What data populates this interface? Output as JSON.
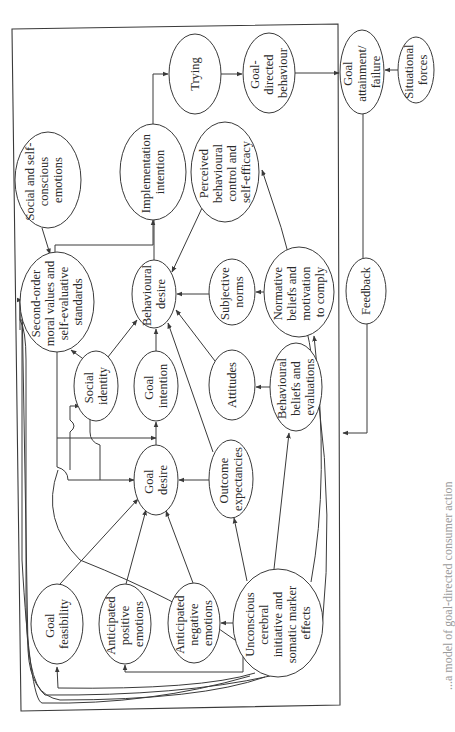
{
  "diagram": {
    "orientation": "rotated-90-ccw",
    "colors": {
      "stroke": "#3a3a3a",
      "text": "#2a2a2a",
      "background": "#ffffff"
    },
    "nodes": {
      "social_self_conscious_emotions": {
        "lines": [
          "Social and self-",
          "conscious",
          "emotions"
        ]
      },
      "implementation_intention": {
        "lines": [
          "Implementation",
          "intention"
        ]
      },
      "trying": {
        "lines": [
          "Trying"
        ]
      },
      "goal_directed_behaviour": {
        "lines": [
          "Goal-",
          "directed",
          "behaviour"
        ]
      },
      "goal_attainment_failure": {
        "lines": [
          "Goal",
          "attainment/",
          "failure"
        ]
      },
      "situational_forces": {
        "lines": [
          "Situational",
          "forces"
        ]
      },
      "perceived_behavioural_control": {
        "lines": [
          "Perceived",
          "behavioural",
          "control and",
          "self-efficacy"
        ]
      },
      "second_order_moral_values": {
        "lines": [
          "Second-order",
          "moral values and",
          "self-evaluative",
          "standards"
        ]
      },
      "behavioural_desire": {
        "lines": [
          "Behavioural",
          "desire"
        ]
      },
      "subjective_norms": {
        "lines": [
          "Subjective",
          "norms"
        ]
      },
      "normative_beliefs": {
        "lines": [
          "Normative",
          "beliefs and",
          "motivation",
          "to comply"
        ]
      },
      "feedback": {
        "lines": [
          "Feedback"
        ]
      },
      "social_identity": {
        "lines": [
          "Social",
          "identity"
        ]
      },
      "goal_intention": {
        "lines": [
          "Goal",
          "intention"
        ]
      },
      "attitudes": {
        "lines": [
          "Attitudes"
        ]
      },
      "behavioural_beliefs": {
        "lines": [
          "Behavioural",
          "beliefs and",
          "evaluations"
        ]
      },
      "goal_desire": {
        "lines": [
          "Goal",
          "desire"
        ]
      },
      "outcome_expectancies": {
        "lines": [
          "Outcome",
          "expectancies"
        ]
      },
      "goal_feasibility": {
        "lines": [
          "Goal",
          "feasibility"
        ]
      },
      "anticipated_positive_emotions": {
        "lines": [
          "Anticipated",
          "positive",
          "emotions"
        ]
      },
      "anticipated_negative_emotions": {
        "lines": [
          "Anticipated",
          "negative",
          "emotions"
        ]
      },
      "unconscious_cerebral_initiative": {
        "lines": [
          "Unconscious",
          "cerebral",
          "initiative and",
          "somatic marker",
          "effects"
        ]
      }
    },
    "edges": [
      [
        "implementation_intention",
        "trying"
      ],
      [
        "trying",
        "goal_directed_behaviour"
      ],
      [
        "goal_directed_behaviour",
        "goal_attainment_failure"
      ],
      [
        "situational_forces",
        "goal_attainment_failure"
      ],
      [
        "goal_attainment_failure",
        "feedback"
      ],
      [
        "feedback",
        "behavioural_beliefs"
      ],
      [
        "social_self_conscious_emotions",
        "second_order_moral_values"
      ],
      [
        "second_order_moral_values",
        "implementation_intention"
      ],
      [
        "second_order_moral_values",
        "goal_intention"
      ],
      [
        "second_order_moral_values",
        "goal_desire"
      ],
      [
        "social_identity",
        "second_order_moral_values"
      ],
      [
        "social_identity",
        "behavioural_desire"
      ],
      [
        "goal_desire",
        "social_identity"
      ],
      [
        "behavioural_desire",
        "implementation_intention"
      ],
      [
        "perceived_behavioural_control",
        "behavioural_desire"
      ],
      [
        "subjective_norms",
        "behavioural_desire"
      ],
      [
        "normative_beliefs",
        "subjective_norms"
      ],
      [
        "goal_intention",
        "behavioural_desire"
      ],
      [
        "attitudes",
        "behavioural_desire"
      ],
      [
        "behavioural_beliefs",
        "attitudes"
      ],
      [
        "outcome_expectancies",
        "behavioural_desire"
      ],
      [
        "goal_desire",
        "goal_intention"
      ],
      [
        "outcome_expectancies",
        "goal_desire"
      ],
      [
        "goal_feasibility",
        "goal_desire"
      ],
      [
        "anticipated_positive_emotions",
        "goal_desire"
      ],
      [
        "anticipated_negative_emotions",
        "goal_desire"
      ],
      [
        "unconscious_cerebral_initiative",
        "anticipated_negative_emotions"
      ],
      [
        "unconscious_cerebral_initiative",
        "anticipated_positive_emotions"
      ],
      [
        "unconscious_cerebral_initiative",
        "goal_feasibility"
      ],
      [
        "unconscious_cerebral_initiative",
        "outcome_expectancies"
      ],
      [
        "unconscious_cerebral_initiative",
        "behavioural_beliefs"
      ],
      [
        "unconscious_cerebral_initiative",
        "normative_beliefs"
      ],
      [
        "unconscious_cerebral_initiative",
        "perceived_behavioural_control"
      ],
      [
        "unconscious_cerebral_initiative",
        "second_order_moral_values"
      ]
    ],
    "caption": "...a model of goal-directed consumer action"
  }
}
